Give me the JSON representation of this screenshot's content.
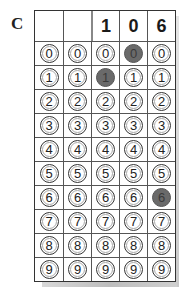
{
  "label": "C",
  "header": [
    "",
    "",
    "1",
    "0",
    "6"
  ],
  "digits": [
    "0",
    "1",
    "2",
    "3",
    "4",
    "5",
    "6",
    "7",
    "8",
    "9"
  ],
  "selected": [
    null,
    null,
    "1",
    "0",
    "6"
  ],
  "colors": {
    "filled": "#6a6a6a",
    "border": "#333333"
  }
}
